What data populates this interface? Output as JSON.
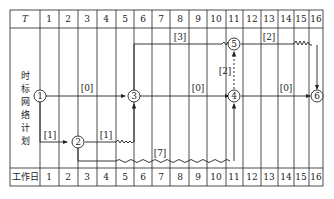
{
  "table": {
    "header_label": "T",
    "footer_label": "工作日",
    "side_label": [
      "时",
      "标",
      "网",
      "络",
      "计",
      "划"
    ],
    "columns": [
      "1",
      "2",
      "3",
      "4",
      "5",
      "6",
      "7",
      "8",
      "9",
      "10",
      "11",
      "12",
      "13",
      "14",
      "15",
      "16"
    ]
  },
  "nodes": [
    {
      "id": "1",
      "label": "1"
    },
    {
      "id": "2",
      "label": "2"
    },
    {
      "id": "3",
      "label": "3"
    },
    {
      "id": "4",
      "label": "4"
    },
    {
      "id": "5",
      "label": "5"
    },
    {
      "id": "6",
      "label": "6"
    }
  ],
  "labels": {
    "l13": "[0]",
    "l35": "[3]",
    "l56": "[2]",
    "l45": "[2]",
    "l34": "[0]",
    "l46": "[0]",
    "l12": "[1]",
    "l23": "[1]",
    "l24": "[7]"
  },
  "colors": {
    "line": "#222222",
    "background": "#ffffff"
  }
}
